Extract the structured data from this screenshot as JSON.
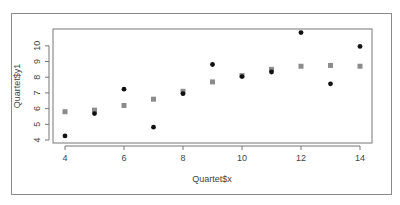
{
  "chart_data": {
    "type": "scatter",
    "title": "",
    "xlabel": "Quartet$x",
    "ylabel": "Quartet$y1",
    "xlim": [
      4,
      14
    ],
    "ylim": [
      4,
      10.9
    ],
    "x_ticks": [
      4,
      6,
      8,
      10,
      12,
      14
    ],
    "y_ticks": [
      4,
      5,
      6,
      7,
      8,
      9,
      10
    ],
    "grid": false,
    "legend": null,
    "series": [
      {
        "name": "y1 (observed)",
        "marker": "circle",
        "color": "#111111",
        "points": [
          {
            "x": 4,
            "y": 4.26
          },
          {
            "x": 5,
            "y": 5.68
          },
          {
            "x": 6,
            "y": 7.24
          },
          {
            "x": 7,
            "y": 4.82
          },
          {
            "x": 8,
            "y": 6.95
          },
          {
            "x": 9,
            "y": 8.81
          },
          {
            "x": 10,
            "y": 8.04
          },
          {
            "x": 11,
            "y": 8.33
          },
          {
            "x": 12,
            "y": 10.84
          },
          {
            "x": 13,
            "y": 7.58
          },
          {
            "x": 14,
            "y": 9.96
          }
        ]
      },
      {
        "name": "fitted",
        "marker": "square",
        "color": "#8c8c8c",
        "points": [
          {
            "x": 4,
            "y": 5.8
          },
          {
            "x": 5,
            "y": 5.9
          },
          {
            "x": 6,
            "y": 6.2
          },
          {
            "x": 7,
            "y": 6.6
          },
          {
            "x": 8,
            "y": 7.1
          },
          {
            "x": 9,
            "y": 7.7
          },
          {
            "x": 10,
            "y": 8.1
          },
          {
            "x": 11,
            "y": 8.5
          },
          {
            "x": 12,
            "y": 8.7
          },
          {
            "x": 13,
            "y": 8.75
          },
          {
            "x": 14,
            "y": 8.7
          }
        ]
      }
    ]
  }
}
